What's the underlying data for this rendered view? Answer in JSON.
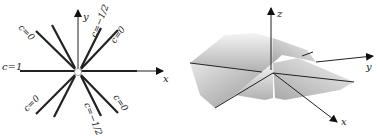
{
  "left_figure": {
    "axes": {
      "x_label": "x",
      "y_label": "y"
    },
    "line_labels": [
      {
        "id": "upper-left",
        "text": "c=0"
      },
      {
        "id": "upper-right-steep",
        "text": "c=−1/2"
      },
      {
        "id": "upper-right",
        "text": "c=0"
      },
      {
        "id": "horizontal",
        "text": "c=1"
      },
      {
        "id": "lower-left",
        "text": "c=0"
      },
      {
        "id": "lower-right-steep",
        "text": "c=−1/2"
      },
      {
        "id": "lower-right",
        "text": "c=0"
      }
    ]
  },
  "right_figure": {
    "axes": {
      "x_label": "x",
      "y_label": "y",
      "z_label": "z"
    },
    "surface_colors": {
      "light": "#f2f2f2",
      "mid": "#c8c8c8",
      "dark": "#8a8a8a"
    },
    "caption_partial": "z = f"
  }
}
